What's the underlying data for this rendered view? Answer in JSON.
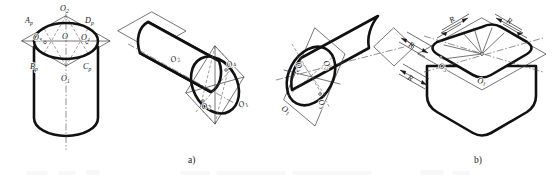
{
  "figure": {
    "background_color": "#ffffff",
    "line_color": "#111111",
    "thin_line_color": "#2b2b2b",
    "captions": [
      {
        "id": "caption-a",
        "text": "a)",
        "x": 192,
        "y": 162
      },
      {
        "id": "caption-b",
        "text": "b)",
        "x": 478,
        "y": 162
      }
    ]
  },
  "panels": [
    {
      "id": "panel-1",
      "name": "vertical-cylinder-construction",
      "labels": [
        {
          "text": "O",
          "sub": "2",
          "x": 63,
          "y": 11
        },
        {
          "text": "A",
          "sub": "p",
          "x": 29,
          "y": 22
        },
        {
          "text": "D",
          "sub": "p",
          "x": 89,
          "y": 22
        },
        {
          "text": "O",
          "sub": "3",
          "x": 38,
          "y": 40
        },
        {
          "text": "O",
          "sub": "",
          "x": 66,
          "y": 39
        },
        {
          "text": "O",
          "sub": "4",
          "x": 87,
          "y": 40
        },
        {
          "text": "B",
          "sub": "p",
          "x": 34,
          "y": 68
        },
        {
          "text": "C",
          "sub": "p",
          "x": 86,
          "y": 68
        },
        {
          "text": "O",
          "sub": "1",
          "x": 65,
          "y": 80
        }
      ]
    },
    {
      "id": "panel-2",
      "name": "horizontal-cylinder-left-isometric",
      "labels": [
        {
          "text": "O",
          "sub": "2",
          "x": 178,
          "y": 63
        },
        {
          "text": "O",
          "sub": "4",
          "x": 220,
          "y": 68
        },
        {
          "text": "O",
          "sub": "3",
          "x": 196,
          "y": 108
        },
        {
          "text": "O",
          "sub": "1",
          "x": 234,
          "y": 106
        }
      ]
    },
    {
      "id": "panel-3",
      "name": "horizontal-cylinder-right-isometric",
      "labels": [
        {
          "text": "O",
          "sub": "4",
          "x": 299,
          "y": 64
        },
        {
          "text": "O",
          "sub": "2",
          "x": 327,
          "y": 62
        },
        {
          "text": "O",
          "sub": "3",
          "x": 315,
          "y": 102
        },
        {
          "text": "O",
          "sub": "1",
          "x": 286,
          "y": 108
        }
      ]
    },
    {
      "id": "panel-4",
      "name": "rounded-prism-radii",
      "labels": [
        {
          "text": "O",
          "sub": "3",
          "x": 443,
          "y": 66
        },
        {
          "text": "O",
          "sub": "1",
          "x": 482,
          "y": 81
        }
      ],
      "dimensions": [
        {
          "text": "R",
          "x": 455,
          "y": 23
        },
        {
          "text": "R",
          "x": 508,
          "y": 23
        },
        {
          "text": "R",
          "x": 412,
          "y": 47
        },
        {
          "text": "R",
          "x": 410,
          "y": 79
        }
      ]
    }
  ]
}
